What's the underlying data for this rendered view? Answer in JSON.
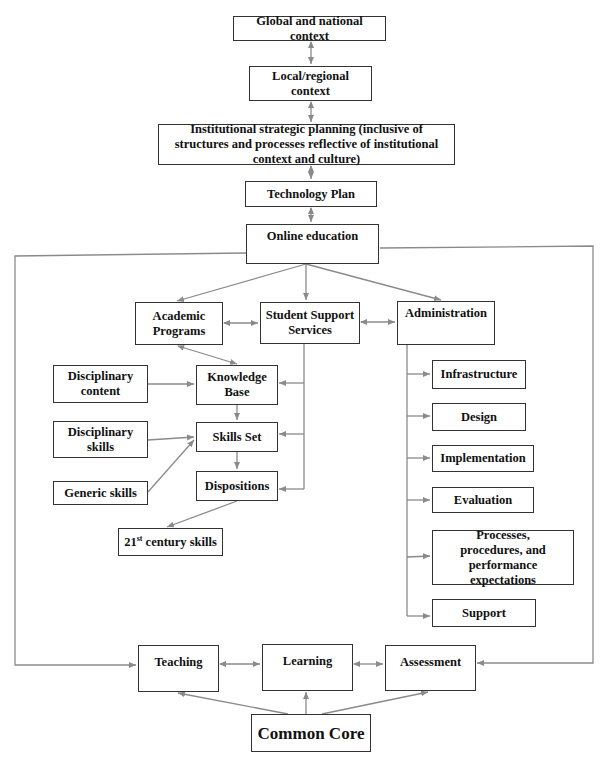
{
  "diagram": {
    "header_text": "Figure: Strategic planning framework for online education (partially cropped caption)",
    "nodes": {
      "global": "Global and national context",
      "local": "Local/regional context",
      "institutional": "Institutional strategic planning (inclusive of structures and processes reflective of institutional context and culture)",
      "technology_plan": "Technology Plan",
      "online_education": "Online education",
      "academic_programs": "Academic Programs",
      "student_support": "Student Support Services",
      "administration": "Administration",
      "disciplinary_content": "Disciplinary content",
      "knowledge_base": "Knowledge Base",
      "disciplinary_skills": "Disciplinary skills",
      "skills_set": "Skills Set",
      "generic_skills": "Generic skills",
      "dispositions": "Dispositions",
      "century_skills_num": "21",
      "century_skills_sup": "st",
      "century_skills_text": " century skills",
      "infrastructure": "Infrastructure",
      "design": "Design",
      "implementation": "Implementation",
      "evaluation": "Evaluation",
      "processes": "Processes, procedures, and performance expectations",
      "support": "Support",
      "teaching": "Teaching",
      "learning": "Learning",
      "assessment": "Assessment",
      "common_core": "Common Core"
    },
    "colors": {
      "arrow": "#8a8a8a",
      "box_border": "#333333",
      "text": "#111111"
    }
  }
}
